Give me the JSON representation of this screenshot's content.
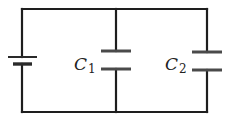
{
  "diagram": {
    "type": "circuit",
    "components": [
      {
        "id": "battery",
        "kind": "battery",
        "label": ""
      },
      {
        "id": "C1",
        "kind": "capacitor",
        "label_main": "C",
        "label_sub": "1"
      },
      {
        "id": "C2",
        "kind": "capacitor",
        "label_main": "C",
        "label_sub": "2"
      }
    ],
    "topology": "parallel",
    "colors": {
      "wire": "#1e1e1e",
      "plate": "#4a4a4a",
      "background": "#ffffff"
    }
  }
}
